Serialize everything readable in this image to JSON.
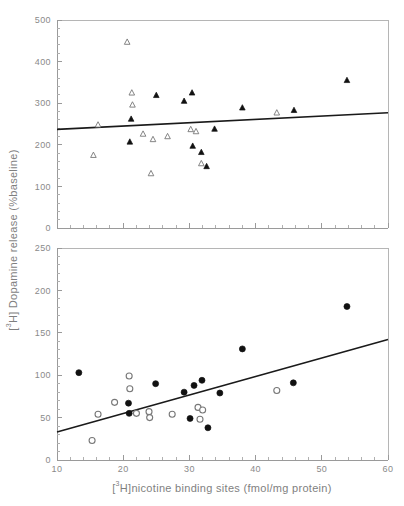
{
  "figure": {
    "width": 404,
    "height": 506,
    "background": "#ffffff",
    "line_color": "#1a1a1a",
    "axis_color": "#9a9a9a",
    "text_color": "#7f7f7f"
  },
  "axis_titles": {
    "y_prefix": "[",
    "y_sup": "3",
    "y_main": "H] Dopamine release (%baseline)",
    "y_full": "[³H] Dopamine release (%baseline)",
    "x_prefix": "[",
    "x_sup": "3",
    "x_main": "H]nicotine binding sites (fmol/mg protein)",
    "x_full": "[³H]nicotine binding sites (fmol/mg protein)"
  },
  "chart_data": [
    {
      "type": "scatter",
      "panel": "top",
      "title": "",
      "xlabel": "",
      "ylabel": "[³H] Dopamine release (%baseline)",
      "xlim": [
        10,
        60
      ],
      "ylim": [
        0,
        500
      ],
      "xticks": [
        10,
        20,
        30,
        40,
        50,
        60
      ],
      "xticklabels": [
        "",
        "",
        "",
        "",
        "",
        ""
      ],
      "yticks": [
        0,
        100,
        200,
        300,
        400,
        500
      ],
      "yticklabels": [
        "0",
        "100",
        "200",
        "300",
        "400",
        "500"
      ],
      "minor_tick_step_y": 20,
      "minor_tick_step_x": 2,
      "grid": false,
      "legend": "none",
      "series": [
        {
          "name": "open-triangle",
          "marker": "triangle-open",
          "points": [
            [
              15.5,
              175
            ],
            [
              16.2,
              248
            ],
            [
              20.6,
              447
            ],
            [
              21.3,
              325
            ],
            [
              21.4,
              296
            ],
            [
              23.0,
              226
            ],
            [
              24.5,
              213
            ],
            [
              24.2,
              131
            ],
            [
              26.7,
              220
            ],
            [
              30.2,
              237
            ],
            [
              31.8,
              155
            ],
            [
              43.2,
              277
            ],
            [
              31.0,
              232
            ]
          ]
        },
        {
          "name": "filled-triangle",
          "marker": "triangle-filled",
          "points": [
            [
              21.2,
              262
            ],
            [
              21.0,
              207
            ],
            [
              25.0,
              319
            ],
            [
              29.2,
              305
            ],
            [
              30.4,
              325
            ],
            [
              30.5,
              197
            ],
            [
              31.8,
              182
            ],
            [
              32.6,
              148
            ],
            [
              33.8,
              238
            ],
            [
              38.0,
              289
            ],
            [
              45.8,
              283
            ],
            [
              53.8,
              355
            ]
          ]
        }
      ],
      "regression_line": {
        "x1": 10,
        "y1": 237,
        "x2": 60,
        "y2": 277
      }
    },
    {
      "type": "scatter",
      "panel": "bottom",
      "title": "",
      "xlabel": "[³H]nicotine binding sites (fmol/mg protein)",
      "ylabel": "[³H] Dopamine release (%baseline)",
      "xlim": [
        10,
        60
      ],
      "ylim": [
        0,
        250
      ],
      "xticks": [
        10,
        20,
        30,
        40,
        50,
        60
      ],
      "xticklabels": [
        "10",
        "20",
        "30",
        "40",
        "50",
        "60"
      ],
      "yticks": [
        0,
        50,
        100,
        150,
        200,
        250
      ],
      "yticklabels": [
        "0",
        "50",
        "100",
        "150",
        "200",
        "250"
      ],
      "minor_tick_step_y": 10,
      "minor_tick_step_x": 2,
      "grid": false,
      "legend": "none",
      "series": [
        {
          "name": "open-circle",
          "marker": "circle-open",
          "points": [
            [
              15.3,
              23
            ],
            [
              16.2,
              54
            ],
            [
              18.7,
              68
            ],
            [
              20.9,
              99
            ],
            [
              21.0,
              84
            ],
            [
              22.0,
              55
            ],
            [
              23.9,
              57
            ],
            [
              24.0,
              50
            ],
            [
              27.4,
              54
            ],
            [
              31.3,
              62
            ],
            [
              31.6,
              48
            ],
            [
              32.0,
              59
            ],
            [
              43.2,
              82
            ]
          ]
        },
        {
          "name": "filled-circle",
          "marker": "circle-filled",
          "points": [
            [
              13.3,
              103
            ],
            [
              20.8,
              67
            ],
            [
              20.9,
              55
            ],
            [
              24.9,
              90
            ],
            [
              29.2,
              80
            ],
            [
              30.1,
              49
            ],
            [
              30.7,
              88
            ],
            [
              31.9,
              94
            ],
            [
              32.8,
              38
            ],
            [
              34.6,
              79
            ],
            [
              38.0,
              131
            ],
            [
              45.7,
              91
            ],
            [
              53.8,
              181
            ]
          ]
        }
      ],
      "regression_line": {
        "x1": 10,
        "y1": 33,
        "x2": 60,
        "y2": 142
      }
    }
  ]
}
